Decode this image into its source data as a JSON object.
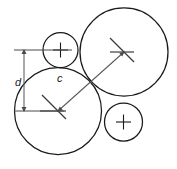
{
  "figure": {
    "background_color": "#ffffff",
    "line_color": "#1a1a1a",
    "dimension_color": "#5a5a5a"
  },
  "labels": {
    "d": "d",
    "c": "c"
  },
  "circles": [
    {
      "name": "small-circle-top-left",
      "cx": 60.5,
      "cy": 50.0,
      "r": 17.5,
      "center_marker": "plus"
    },
    {
      "name": "large-circle-bottom-left",
      "cx": 58.0,
      "cy": 111.0,
      "r": 43.5,
      "center_marker": "tick"
    },
    {
      "name": "large-circle-top-right",
      "cx": 124.0,
      "cy": 52.0,
      "r": 44.0,
      "center_marker": "tick"
    },
    {
      "name": "small-circle-bottom-right",
      "cx": 123.5,
      "cy": 122.0,
      "r": 19.0,
      "center_marker": "plus"
    }
  ],
  "dimensions": [
    {
      "name": "dimension-d",
      "label": "d",
      "type": "vertical",
      "x": 24.0,
      "y_top": 50.0,
      "y_bottom": 111.0,
      "label_x": 18.0,
      "label_y": 83.0,
      "extension_top": {
        "x1": 14.0,
        "y1": 50.0,
        "x2": 72.0,
        "y2": 50.0
      },
      "extension_bottom": {
        "x1": 14.0,
        "y1": 111.0,
        "x2": 64.0,
        "y2": 111.0
      }
    },
    {
      "name": "dimension-c",
      "label": "c",
      "type": "diagonal",
      "x1": 58.0,
      "y1": 111.0,
      "x2": 124.0,
      "y2": 52.0,
      "label_x": 60.0,
      "label_y": 79.0
    }
  ],
  "center_marks": [
    {
      "name": "center-mark-bottom-left",
      "cx": 58.0,
      "cy": 111.0,
      "angle_deg": 45,
      "arm": 20
    },
    {
      "name": "center-mark-top-right",
      "cx": 124.0,
      "cy": 52.0,
      "angle_deg": 45,
      "arm": 20
    }
  ]
}
